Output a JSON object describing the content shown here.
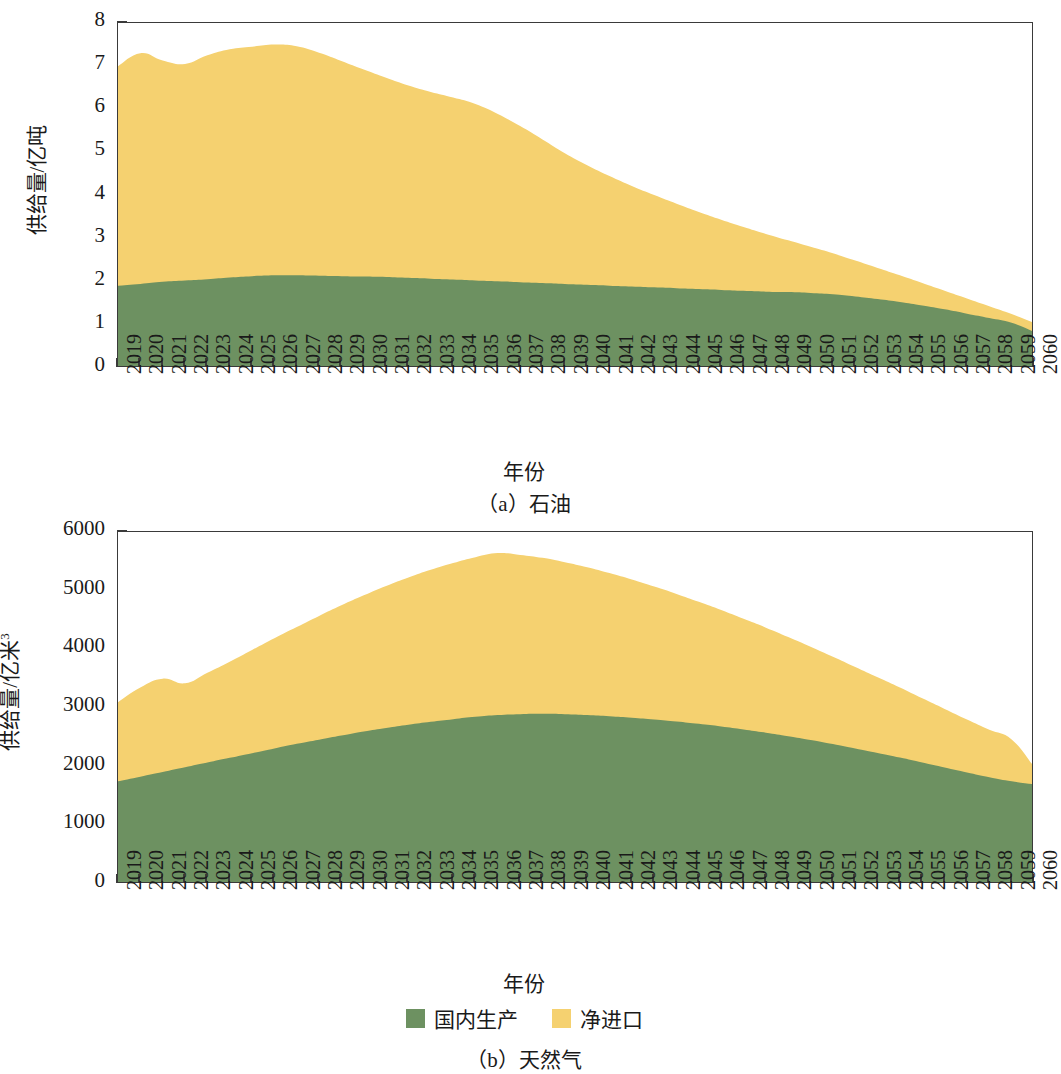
{
  "figures": [
    {
      "id": "a",
      "caption": "（a）石油",
      "xlabel": "年份",
      "ylabel_main": "供给量/亿吨",
      "ylabel_sup": ""
    },
    {
      "id": "b",
      "caption": "（b）天然气",
      "xlabel": "年份",
      "ylabel_main": "供给量/亿米",
      "ylabel_sup": "3"
    }
  ],
  "legend": {
    "items": [
      {
        "label": "国内生产",
        "color": "#6D9161"
      },
      {
        "label": "净进口",
        "color": "#F5D170"
      }
    ]
  },
  "colors": {
    "domestic": "#6D9161",
    "imports": "#F5D170",
    "axis": "#3a3a3a",
    "text": "#1a1a1a"
  },
  "chart_data": [
    {
      "type": "area",
      "stacked": true,
      "id": "petroleum",
      "title": "（a）石油",
      "xlabel": "年份",
      "ylabel": "供给量/亿吨",
      "ylim": [
        0,
        8
      ],
      "yticks": [
        0,
        1,
        2,
        3,
        4,
        5,
        6,
        7,
        8
      ],
      "grid": false,
      "legend_position": "below-figure-b",
      "x": [
        2019,
        2020,
        2021,
        2022,
        2023,
        2024,
        2025,
        2026,
        2027,
        2028,
        2029,
        2030,
        2031,
        2032,
        2033,
        2034,
        2035,
        2036,
        2037,
        2038,
        2039,
        2040,
        2041,
        2042,
        2043,
        2044,
        2045,
        2046,
        2047,
        2048,
        2049,
        2050,
        2051,
        2052,
        2053,
        2054,
        2055,
        2056,
        2057,
        2058,
        2059,
        2060
      ],
      "series": [
        {
          "name": "国内生产",
          "color": "#6D9161",
          "values": [
            1.91,
            1.95,
            2.0,
            2.03,
            2.06,
            2.1,
            2.13,
            2.15,
            2.15,
            2.14,
            2.13,
            2.12,
            2.11,
            2.09,
            2.07,
            2.05,
            2.03,
            2.01,
            1.99,
            1.97,
            1.95,
            1.93,
            1.91,
            1.89,
            1.87,
            1.85,
            1.83,
            1.81,
            1.79,
            1.77,
            1.76,
            1.74,
            1.71,
            1.66,
            1.6,
            1.53,
            1.45,
            1.36,
            1.26,
            1.16,
            1.05,
            0.84
          ]
        },
        {
          "name": "净进口",
          "color": "#F5D170",
          "values": [
            5.09,
            5.35,
            5.13,
            5.02,
            5.19,
            5.29,
            5.32,
            5.35,
            5.31,
            5.17,
            4.99,
            4.8,
            4.62,
            4.46,
            4.33,
            4.22,
            4.09,
            3.88,
            3.62,
            3.33,
            3.03,
            2.77,
            2.54,
            2.33,
            2.14,
            1.96,
            1.79,
            1.63,
            1.48,
            1.34,
            1.2,
            1.07,
            0.95,
            0.83,
            0.72,
            0.62,
            0.52,
            0.43,
            0.35,
            0.27,
            0.2,
            0.21
          ]
        }
      ],
      "totals": [
        7.0,
        7.3,
        7.13,
        7.05,
        7.25,
        7.39,
        7.45,
        7.5,
        7.46,
        7.31,
        7.12,
        6.92,
        6.73,
        6.55,
        6.4,
        6.27,
        6.12,
        5.89,
        5.61,
        5.3,
        4.98,
        4.7,
        4.45,
        4.22,
        4.01,
        3.81,
        3.62,
        3.44,
        3.27,
        3.11,
        2.96,
        2.81,
        2.66,
        2.49,
        2.32,
        2.15,
        1.97,
        1.79,
        1.61,
        1.43,
        1.25,
        1.05
      ]
    },
    {
      "type": "area",
      "stacked": true,
      "id": "natural-gas",
      "title": "（b）天然气",
      "xlabel": "年份",
      "ylabel": "供给量/亿米3",
      "ylim": [
        0,
        6000
      ],
      "yticks": [
        0,
        1000,
        2000,
        3000,
        4000,
        5000,
        6000
      ],
      "grid": false,
      "legend_position": "below",
      "x": [
        2019,
        2020,
        2021,
        2022,
        2023,
        2024,
        2025,
        2026,
        2027,
        2028,
        2029,
        2030,
        2031,
        2032,
        2033,
        2034,
        2035,
        2036,
        2037,
        2038,
        2039,
        2040,
        2041,
        2042,
        2043,
        2044,
        2045,
        2046,
        2047,
        2048,
        2049,
        2050,
        2051,
        2052,
        2053,
        2054,
        2055,
        2056,
        2057,
        2058,
        2059,
        2060
      ],
      "series": [
        {
          "name": "国内生产",
          "color": "#6D9161",
          "values": [
            1750,
            1830,
            1910,
            1990,
            2070,
            2150,
            2230,
            2310,
            2390,
            2460,
            2530,
            2600,
            2660,
            2715,
            2765,
            2810,
            2850,
            2880,
            2895,
            2900,
            2895,
            2880,
            2860,
            2835,
            2805,
            2770,
            2730,
            2685,
            2635,
            2580,
            2520,
            2455,
            2385,
            2310,
            2235,
            2155,
            2070,
            1985,
            1900,
            1820,
            1750,
            1700
          ]
        },
        {
          "name": "净进口",
          "color": "#F5D170",
          "values": [
            1350,
            1520,
            1590,
            1430,
            1530,
            1640,
            1760,
            1880,
            1990,
            2110,
            2220,
            2320,
            2420,
            2510,
            2590,
            2660,
            2720,
            2760,
            2715,
            2660,
            2590,
            2520,
            2440,
            2355,
            2265,
            2175,
            2080,
            1985,
            1885,
            1790,
            1690,
            1590,
            1490,
            1390,
            1290,
            1195,
            1095,
            1000,
            905,
            810,
            715,
            300
          ]
        }
      ],
      "totals": [
        3100,
        3350,
        3500,
        3420,
        3600,
        3790,
        3990,
        4190,
        4380,
        4570,
        4750,
        4920,
        5080,
        5225,
        5355,
        5470,
        5570,
        5640,
        5610,
        5560,
        5485,
        5400,
        5300,
        5190,
        5070,
        4945,
        4810,
        4670,
        4520,
        4370,
        4210,
        4045,
        3875,
        3700,
        3525,
        3350,
        3165,
        2985,
        2805,
        2630,
        2465,
        2000
      ]
    }
  ]
}
